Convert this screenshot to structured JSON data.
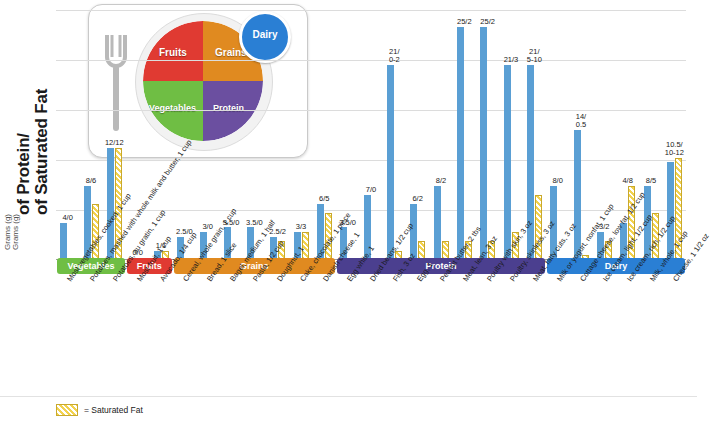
{
  "axis": {
    "ylabel_line1": "of Protein/",
    "ylabel_line2": "of Saturated Fat",
    "ylabel_unit1": "Grams (g)",
    "ylabel_unit2": "Grams (g)"
  },
  "plate": {
    "fruits": "Fruits",
    "grains": "Grains",
    "vegetables": "Vegetables",
    "protein": "Protein",
    "dairy": "Dairy"
  },
  "legend": {
    "label": "= Saturated Fat"
  },
  "chart_data": {
    "type": "bar",
    "title": "",
    "xlabel": "",
    "ylabel": "Grams (g) of Protein/ Grams (g) of Saturated Fat",
    "ylim": [
      0,
      26
    ],
    "grid": true,
    "legend_position": "bottom-left",
    "series": [
      {
        "name": "Protein",
        "color": "#5a9fd4"
      },
      {
        "name": "Saturated Fat",
        "color": "#f2d24e"
      }
    ],
    "groups": [
      {
        "category": "Vegetables",
        "label": "Most vegetables, cooked, 1 cup",
        "datalabel": "4/0",
        "protein": 4,
        "fat": 0
      },
      {
        "category": "Vegetables",
        "label": "Potatoes, mashed with whole milk and butter, 1 cup",
        "datalabel": "8/6",
        "protein": 8,
        "fat": 6
      },
      {
        "category": "Vegetables",
        "label": "Potatoes, au gratin, 1 cup",
        "datalabel": "12/12",
        "protein": 12,
        "fat": 12
      },
      {
        "category": "Fruits",
        "label": "Most fruit, 1 cup",
        "datalabel": "0/0",
        "protein": 0,
        "fat": 0
      },
      {
        "category": "Fruits",
        "label": "Avocado, 1/4 cup",
        "datalabel": "1/1",
        "protein": 1,
        "fat": 1
      },
      {
        "category": "Grains",
        "label": "Cereal, whole grain, 1 cup",
        "datalabel": "2.5/0",
        "protein": 2.5,
        "fat": 0
      },
      {
        "category": "Grains",
        "label": "Bread, 1 slice",
        "datalabel": "3/0",
        "protein": 3,
        "fat": 0
      },
      {
        "category": "Grains",
        "label": "Bagel, medium, 1 half",
        "datalabel": "3.5/0",
        "protein": 3.5,
        "fat": 0
      },
      {
        "category": "Grains",
        "label": "Pasta, 1/2 cup",
        "datalabel": "3.5/0",
        "protein": 3.5,
        "fat": 0
      },
      {
        "category": "Grains",
        "label": "Doughnut, 1",
        "datalabel": "2.5/2",
        "protein": 2.5,
        "fat": 2
      },
      {
        "category": "Grains",
        "label": "Cake, chocolate, 1 piece",
        "datalabel": "3/3",
        "protein": 3,
        "fat": 3
      },
      {
        "category": "Grains",
        "label": "Danish cheese, 1",
        "datalabel": "6/5",
        "protein": 6,
        "fat": 5
      },
      {
        "category": "Protein",
        "label": "Egg white, 1",
        "datalabel": "3.5/0",
        "protein": 3.5,
        "fat": 0
      },
      {
        "category": "Protein",
        "label": "Dried beans, 1/2 cup",
        "datalabel": "7/0",
        "protein": 7,
        "fat": 0
      },
      {
        "category": "Protein",
        "label": "Fish, 3 oz",
        "datalabel": "21/0-2",
        "protein": 21,
        "fat": 1
      },
      {
        "category": "Protein",
        "label": "Egg, 1",
        "datalabel": "6/2",
        "protein": 6,
        "fat": 2
      },
      {
        "category": "Protein",
        "label": "Peanut butter, 2 tbs",
        "datalabel": "8/2",
        "protein": 8,
        "fat": 2
      },
      {
        "category": "Protein",
        "label": "Meat, lean, 3 oz",
        "datalabel": "25/2",
        "protein": 25,
        "fat": 2
      },
      {
        "category": "Protein",
        "label": "Poultry with skin, 3 oz",
        "datalabel": "25/2",
        "protein": 25,
        "fat": 2
      },
      {
        "category": "Protein",
        "label": "Poultry, skinless, 3 oz",
        "datalabel": "21/3",
        "protein": 21,
        "fat": 3
      },
      {
        "category": "Protein",
        "label": "Meat, fatty cuts, 3 oz",
        "datalabel": "21/5-10",
        "protein": 21,
        "fat": 7
      },
      {
        "category": "Dairy",
        "label": "Milk or yogurt, nonfat, 1 cup",
        "datalabel": "8/0",
        "protein": 8,
        "fat": 0
      },
      {
        "category": "Dairy",
        "label": "Cottage cheese, low fat, 1/2 cup",
        "datalabel": "14/0.5",
        "protein": 14,
        "fat": 0.5
      },
      {
        "category": "Dairy",
        "label": "Ice cream, light, 1/2 cup",
        "datalabel": "3/2",
        "protein": 3,
        "fat": 2
      },
      {
        "category": "Dairy",
        "label": "Ice cream, rich, 1/2 cup",
        "datalabel": "4/8",
        "protein": 4,
        "fat": 8
      },
      {
        "category": "Dairy",
        "label": "Milk, whole, 1 cup",
        "datalabel": "8/5",
        "protein": 8,
        "fat": 5
      },
      {
        "category": "Dairy",
        "label": "Cheese, 1 1/2 oz",
        "datalabel": "10.5/10-12",
        "protein": 10.5,
        "fat": 11
      }
    ],
    "categories": [
      {
        "name": "Vegetables",
        "color": "#6fbe44",
        "start": 0,
        "count": 3
      },
      {
        "name": "Fruits",
        "color": "#e03a32",
        "start": 3,
        "count": 2
      },
      {
        "name": "Grains",
        "color": "#e08a20",
        "start": 5,
        "count": 7
      },
      {
        "name": "Protein",
        "color": "#4b3f8f",
        "start": 12,
        "count": 9
      },
      {
        "name": "Dairy",
        "color": "#2a7fd4",
        "start": 21,
        "count": 6
      }
    ]
  }
}
